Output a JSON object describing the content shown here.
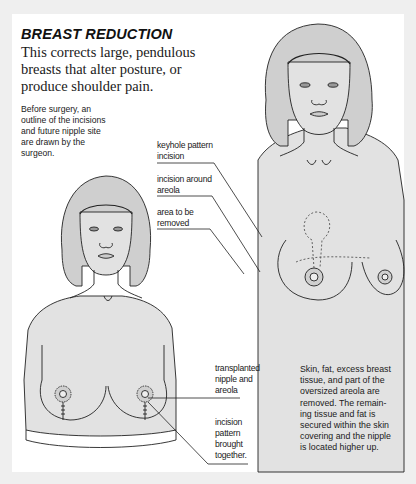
{
  "header": {
    "title": "BREAST REDUCTION",
    "lead": "This corrects large, pendulous breasts that alter posture, or produce shoulder pain."
  },
  "before_note": {
    "lines": [
      "Before surgery, an",
      "outline of the incisions",
      "and future nipple site",
      "are drawn by the",
      "surgeon."
    ]
  },
  "before_labels": [
    {
      "lines": [
        "keyhole pattern",
        "incision"
      ]
    },
    {
      "lines": [
        "incision around",
        "areola"
      ]
    },
    {
      "lines": [
        "area to be",
        "removed"
      ]
    }
  ],
  "after_labels": [
    {
      "lines": [
        "transplanted",
        "nipple and",
        "areola"
      ]
    },
    {
      "lines": [
        "incision",
        "pattern",
        "brought",
        "together."
      ]
    }
  ],
  "after_description": {
    "lines": [
      "Skin, fat, excess breast",
      "tissue, and part of the",
      "oversized areola are",
      "removed. The remain-",
      "ing tissue and fat is",
      "secured within the skin",
      "covering and the nipple",
      "is located higher up."
    ]
  },
  "colors": {
    "background": "#efefef",
    "panel": "#ffffff",
    "figure_fill": "#e2e2e2",
    "line": "#222222",
    "text": "#1a1a1a"
  }
}
